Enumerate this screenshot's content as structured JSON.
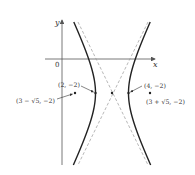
{
  "diagram": {
    "type": "hyperbola-graph",
    "equation": "(x-3)^2 - (y+2)^2/4 = 1",
    "axes": {
      "x_label": "x",
      "y_label": "y",
      "origin_label": "0"
    },
    "points": {
      "vertex_left": {
        "label": "(2, −2)",
        "x": 2,
        "y": -2
      },
      "vertex_right": {
        "label": "(4, −2)",
        "x": 4,
        "y": -2
      },
      "focus_left": {
        "label": "(3 − √5, −2)",
        "x": "3-sqrt(5)",
        "y": -2
      },
      "focus_right": {
        "label": "(3 + √5, −2)",
        "x": "3+sqrt(5)",
        "y": -2
      },
      "center": {
        "x": 3,
        "y": -2
      }
    },
    "asymptotes": [
      "y + 2 = 2(x - 3)",
      "y + 2 = -2(x - 3)"
    ],
    "colors": {
      "curve": "#222222",
      "asymptote": "#999999",
      "axis": "#555555",
      "text": "#333333"
    }
  }
}
